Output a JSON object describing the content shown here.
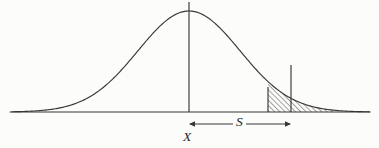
{
  "figure": {
    "type": "statistical-diagram",
    "background_color": "#fcfcfb",
    "ink_color": "#231f20"
  },
  "labels": {
    "mean": "X",
    "spread": "S"
  },
  "chart_data": {
    "type": "line",
    "title": "",
    "subtitle": "",
    "xlabel": "",
    "ylabel": "",
    "grid": false,
    "legend_position": "none",
    "curve": {
      "name": "normal-density",
      "mean_x": 189,
      "std_dev_px": 51,
      "peak_y": 11,
      "baseline_y": 112,
      "x_start": 12,
      "x_end": 370
    },
    "axis": {
      "baseline_y": 112,
      "x_min": 10,
      "x_max": 370
    },
    "markers": [
      {
        "name": "mean-line",
        "x": 189,
        "y_top": 2,
        "y_bottom": 112,
        "label": "X"
      },
      {
        "name": "tail-start-line",
        "x": 268,
        "y_top": 87,
        "y_bottom": 112
      },
      {
        "name": "tail-end-line",
        "x": 291,
        "y_top": 65,
        "y_bottom": 112
      }
    ],
    "shaded_region": {
      "name": "right-tail",
      "fill": "diagonal-hatch",
      "hatch_angle_deg": 45,
      "hatch_spacing_px": 2.6,
      "x_from": 268,
      "x_to": 335
    },
    "measure_arrow": {
      "name": "spread-arrow",
      "label": "S",
      "y": 124,
      "x_from": 189,
      "x_to": 291,
      "double_headed": true
    }
  }
}
